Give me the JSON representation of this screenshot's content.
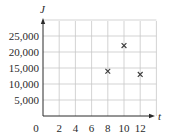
{
  "chart_data": {
    "type": "scatter",
    "title": "",
    "xlabel": "t",
    "ylabel": "J",
    "xlim": [
      0,
      14
    ],
    "ylim": [
      0,
      30000
    ],
    "grid": true,
    "legend": null,
    "marker": "x",
    "x_ticks": [
      0,
      2,
      4,
      6,
      8,
      10,
      12
    ],
    "x_tick_labels": [
      "0",
      "2",
      "4",
      "6",
      "8",
      "10",
      "12"
    ],
    "y_ticks": [
      5000,
      10000,
      15000,
      20000,
      25000
    ],
    "y_tick_labels": [
      "5,000",
      "10,000",
      "15,000",
      "20,000",
      "25,000"
    ],
    "series": [
      {
        "name": "J",
        "points": [
          {
            "x": 8,
            "y": 14000
          },
          {
            "x": 10,
            "y": 22000
          },
          {
            "x": 12,
            "y": 13000
          }
        ]
      }
    ]
  },
  "colors": {
    "grid": "#c8c8c8",
    "axis": "#2a2a2a",
    "marker": "#3a3a3a",
    "text": "#2a2a2a"
  }
}
